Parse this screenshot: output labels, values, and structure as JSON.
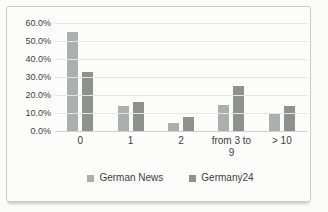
{
  "chart_data": {
    "type": "bar",
    "title": "",
    "xlabel": "",
    "ylabel": "",
    "categories": [
      "0",
      "1",
      "2",
      "from 3 to 9",
      "> 10"
    ],
    "series": [
      {
        "name": "German News",
        "color": "#abb0ae",
        "values": [
          55,
          14,
          4.5,
          14.5,
          10
        ]
      },
      {
        "name": "Germany24",
        "color": "#8d928f",
        "values": [
          33,
          16,
          8,
          25,
          14
        ]
      }
    ],
    "ylim": [
      0,
      60
    ],
    "ytick_step": 10,
    "ytick_labels": [
      "60.0%",
      "50.0%",
      "40.0%",
      "30.0%",
      "20.0%",
      "10.0%",
      "0.0%"
    ],
    "grid": true,
    "legend_position": "bottom"
  }
}
